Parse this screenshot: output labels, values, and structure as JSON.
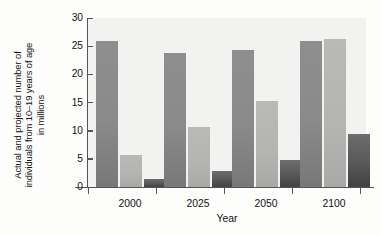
{
  "chart_data": {
    "type": "bar",
    "title": "",
    "xlabel": "Year",
    "ylabel": "Actual and projected number of\nindividuals from 10–19 years of age\nin millions",
    "categories": [
      "2000",
      "2025",
      "2050",
      "2100"
    ],
    "ylim": [
      0,
      30
    ],
    "yticks": [
      "0",
      "5",
      "10",
      "15",
      "20",
      "25",
      "30"
    ],
    "ytick_values": [
      0,
      5,
      10,
      15,
      20,
      25,
      30
    ],
    "grid": false,
    "legend": "none",
    "series": [
      {
        "name": "series-1",
        "style": "medium-gray",
        "values": [
          25.9,
          23.8,
          24.3,
          25.9
        ]
      },
      {
        "name": "series-2",
        "style": "light-gray",
        "values": [
          5.6,
          10.7,
          15.2,
          26.3
        ]
      },
      {
        "name": "series-3",
        "style": "dark-gray",
        "values": [
          1.5,
          2.8,
          4.8,
          9.4
        ]
      },
      {
        "name": "series-4",
        "style": "medium-gray-short",
        "values": [
          5.6,
          6.0,
          6.8,
          8.9
        ]
      }
    ],
    "bars": [
      {
        "group": "2000",
        "index": 0,
        "value": 25.9,
        "style": "medium"
      },
      {
        "group": "2000",
        "index": 1,
        "value": 5.6,
        "style": "medium"
      },
      {
        "group": "2000",
        "index": 2,
        "value": 5.6,
        "style": "light"
      },
      {
        "group": "2000",
        "index": 3,
        "value": 1.5,
        "style": "dark"
      },
      {
        "group": "2025",
        "index": 0,
        "value": 23.8,
        "style": "medium"
      },
      {
        "group": "2025",
        "index": 1,
        "value": 6.0,
        "style": "medium"
      },
      {
        "group": "2025",
        "index": 2,
        "value": 10.7,
        "style": "light"
      },
      {
        "group": "2025",
        "index": 3,
        "value": 2.8,
        "style": "dark"
      },
      {
        "group": "2050",
        "index": 0,
        "value": 24.3,
        "style": "medium"
      },
      {
        "group": "2050",
        "index": 1,
        "value": 6.8,
        "style": "medium"
      },
      {
        "group": "2050",
        "index": 2,
        "value": 15.2,
        "style": "light"
      },
      {
        "group": "2050",
        "index": 3,
        "value": 4.8,
        "style": "dark"
      },
      {
        "group": "2100",
        "index": 0,
        "value": 25.9,
        "style": "medium"
      },
      {
        "group": "2100",
        "index": 1,
        "value": 8.9,
        "style": "medium"
      },
      {
        "group": "2100",
        "index": 2,
        "value": 26.3,
        "style": "light"
      },
      {
        "group": "2100",
        "index": 3,
        "value": 9.4,
        "style": "dark"
      }
    ],
    "colors": {
      "medium": "#8a8a8a",
      "light": "#b4b4b2",
      "dark": "#545454",
      "plot_background": "#f2f2f0",
      "axis": "#555555",
      "text": "#111111"
    },
    "geometry": {
      "bar_width_px": 22,
      "group_positions_px": [
        8,
        76,
        144,
        212
      ],
      "bar_offsets_px": [
        0,
        24,
        24,
        48
      ]
    }
  }
}
